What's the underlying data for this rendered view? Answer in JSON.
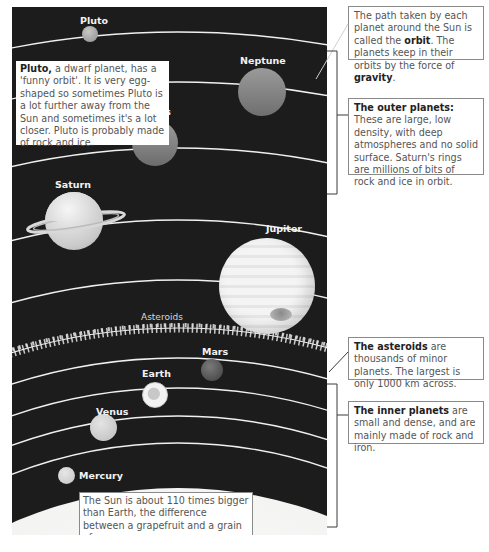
{
  "planets": {
    "pluto": "Pluto",
    "neptune": "Neptune",
    "uranus": "Uranus",
    "saturn": "Saturn",
    "jupiter": "Jupiter",
    "asteroids": "Asteroids",
    "mars": "Mars",
    "earth": "Earth",
    "venus": "Venus",
    "mercury": "Mercury"
  },
  "notes": {
    "pluto": {
      "bold": "Pluto,",
      "text": " a dwarf planet, has a 'funny orbit'. It is very egg-shaped so sometimes Pluto is a lot further away from the Sun and sometimes it's a lot closer. Pluto is probably made of rock and ice."
    },
    "orbit": {
      "text1": "The path taken by each planet around the Sun is called the ",
      "bold1": "orbit",
      "text2": ". The planets keep in their orbits by the force of ",
      "bold2": "gravity",
      "text3": "."
    },
    "outer": {
      "bold": "The outer planets:",
      "text": " These are large, low density, with deep atmospheres and no solid surface. Saturn's rings are millions of bits of rock and ice in orbit."
    },
    "asteroids": {
      "bold": "The asteroids",
      "text": " are thousands of minor planets. The largest is only 1000 km across."
    },
    "inner": {
      "bold": "The inner planets",
      "text": " are small and dense, and are mainly made of rock and iron."
    },
    "sun": {
      "text": "The Sun is about 110 times bigger than Earth, the difference between a grapefruit and a grain of sugar."
    }
  },
  "colors": {
    "background": "#1c1c1c",
    "orbit_line": "#f0f0f0",
    "note_border": "#8a8a8a",
    "sun": "#f4f4f2"
  }
}
